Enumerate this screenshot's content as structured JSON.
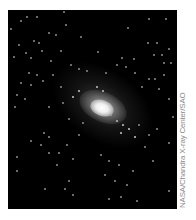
{
  "figure": {
    "background_color": "#000000",
    "core_color": "#ffffff",
    "credit": "NASA/Chandra X-ray Center/SAO"
  },
  "caption": {
    "text": ""
  }
}
